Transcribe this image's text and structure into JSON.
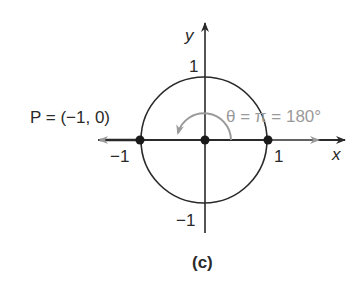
{
  "figure": {
    "caption": "(c)",
    "axes": {
      "x_label": "x",
      "y_label": "y",
      "x_ticks": [
        "−1",
        "1"
      ],
      "y_ticks": [
        "1",
        "−1"
      ]
    },
    "point_label": "P = (−1, 0)",
    "angle_label": "θ = π = 180°",
    "points": [
      {
        "name": "P",
        "x": -1,
        "y": 0
      },
      {
        "name": "origin",
        "x": 0,
        "y": 0
      },
      {
        "name": "unit-point",
        "x": 1,
        "y": 0
      }
    ],
    "colors": {
      "ink": "#2a2a2a",
      "angle": "#9a9a9a"
    }
  }
}
